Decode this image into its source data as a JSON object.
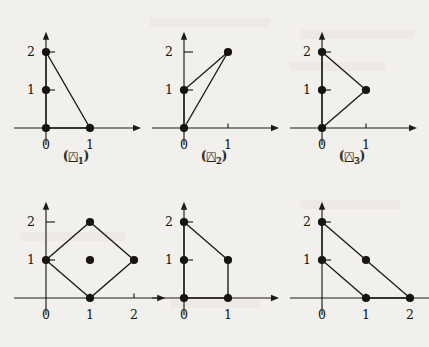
{
  "figure": {
    "background_color": "#f2f0ec",
    "ink_color": "#17150f",
    "panels": [
      {
        "id": "delta-1",
        "caption_open": "(",
        "caption_glyph": "△",
        "caption_sub": "1",
        "caption_close": ")",
        "x_labels": [
          "0",
          "1"
        ],
        "y_labels": [
          "1",
          "2"
        ],
        "x_max": 2,
        "y_max": 2.35,
        "polygon": [
          [
            0,
            0
          ],
          [
            0,
            2
          ],
          [
            1,
            0
          ]
        ],
        "dots": [
          [
            0,
            0
          ],
          [
            0,
            1
          ],
          [
            0,
            2
          ],
          [
            1,
            0
          ]
        ],
        "y_ticks": [
          1,
          2
        ],
        "x_ticks": [
          1
        ]
      },
      {
        "id": "delta-2",
        "caption_open": "(",
        "caption_glyph": "△",
        "caption_sub": "2",
        "caption_close": ")",
        "x_labels": [
          "0",
          "1"
        ],
        "y_labels": [
          "1",
          "2"
        ],
        "x_max": 2,
        "y_max": 2.35,
        "polygon": [
          [
            0,
            0
          ],
          [
            0,
            1
          ],
          [
            1,
            2
          ]
        ],
        "dots": [
          [
            0,
            0
          ],
          [
            0,
            1
          ],
          [
            1,
            2
          ]
        ],
        "y_ticks": [
          1,
          2
        ],
        "x_ticks": [
          1
        ]
      },
      {
        "id": "delta-3",
        "caption_open": "(",
        "caption_glyph": "△",
        "caption_sub": "3",
        "caption_close": ")",
        "x_labels": [
          "0",
          "1"
        ],
        "y_labels": [
          "1",
          "2"
        ],
        "x_max": 2,
        "y_max": 2.35,
        "polygon": [
          [
            0,
            0
          ],
          [
            0,
            2
          ],
          [
            1,
            1
          ]
        ],
        "dots": [
          [
            0,
            0
          ],
          [
            0,
            1
          ],
          [
            0,
            2
          ],
          [
            1,
            1
          ]
        ],
        "y_ticks": [
          1,
          2
        ],
        "x_ticks": [
          1
        ]
      },
      {
        "id": "square-1",
        "caption_open": "(",
        "caption_glyph": "□",
        "caption_sub": "1",
        "caption_close": ")",
        "x_labels": [
          "0",
          "1",
          "2"
        ],
        "y_labels": [
          "1",
          "2"
        ],
        "x_max": 2.55,
        "y_max": 2.35,
        "polygon": [
          [
            1,
            0
          ],
          [
            0,
            1
          ],
          [
            1,
            2
          ],
          [
            2,
            1
          ]
        ],
        "dots": [
          [
            1,
            0
          ],
          [
            0,
            1
          ],
          [
            1,
            1
          ],
          [
            2,
            1
          ],
          [
            1,
            2
          ]
        ],
        "y_ticks": [
          1,
          2
        ],
        "x_ticks": [
          1,
          2
        ]
      },
      {
        "id": "square-2",
        "caption_open": "(",
        "caption_glyph": "□",
        "caption_sub": "2",
        "caption_close": ")",
        "x_labels": [
          "0",
          "1"
        ],
        "y_labels": [
          "1",
          "2"
        ],
        "x_max": 2,
        "y_max": 2.35,
        "polygon": [
          [
            0,
            0
          ],
          [
            1,
            0
          ],
          [
            1,
            1
          ],
          [
            0,
            2
          ]
        ],
        "dots": [
          [
            0,
            0
          ],
          [
            1,
            0
          ],
          [
            0,
            1
          ],
          [
            1,
            1
          ],
          [
            0,
            2
          ]
        ],
        "y_ticks": [
          1,
          2
        ],
        "x_ticks": [
          1
        ]
      },
      {
        "id": "square-3",
        "caption_open": "(",
        "caption_glyph": "□",
        "caption_sub": "3",
        "caption_close": ")",
        "x_labels": [
          "0",
          "1",
          "2"
        ],
        "y_labels": [
          "1",
          "2"
        ],
        "x_max": 2.55,
        "y_max": 2.35,
        "polygon": [
          [
            0,
            1
          ],
          [
            0,
            2
          ],
          [
            2,
            0
          ],
          [
            1,
            0
          ]
        ],
        "dots": [
          [
            0,
            1
          ],
          [
            0,
            2
          ],
          [
            1,
            0
          ],
          [
            2,
            0
          ],
          [
            1,
            1
          ]
        ],
        "y_ticks": [
          1,
          2
        ],
        "x_ticks": [
          1,
          2
        ]
      }
    ]
  }
}
